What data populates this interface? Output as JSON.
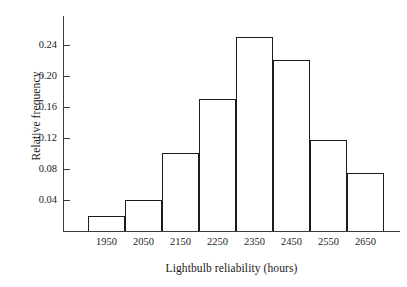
{
  "chart_data": {
    "type": "bar",
    "title": "",
    "xlabel": "Lightbulb reliability (hours)",
    "ylabel": "Relative frequency",
    "categories": [
      "1950",
      "2050",
      "2150",
      "2250",
      "2350",
      "2450",
      "2550",
      "2650"
    ],
    "bin_edges": [
      1900,
      2000,
      2100,
      2200,
      2300,
      2400,
      2500,
      2600,
      2700
    ],
    "values": [
      0.02,
      0.04,
      0.1,
      0.17,
      0.25,
      0.22,
      0.118,
      0.075
    ],
    "ytick_labels": [
      "0.04",
      "0.08",
      "0.12",
      "0.16",
      "0.20",
      "0.24"
    ],
    "ytick_values": [
      0.04,
      0.08,
      0.12,
      0.16,
      0.2,
      0.24
    ],
    "ylim": [
      0,
      0.2773
    ],
    "xlim": [
      1900,
      2700
    ],
    "grid": false,
    "legend": false,
    "bar_fill": "#ffffff",
    "bar_stroke": "#1c1c1c",
    "axis_color": "#3a3a3a",
    "background": "#ffffff"
  }
}
